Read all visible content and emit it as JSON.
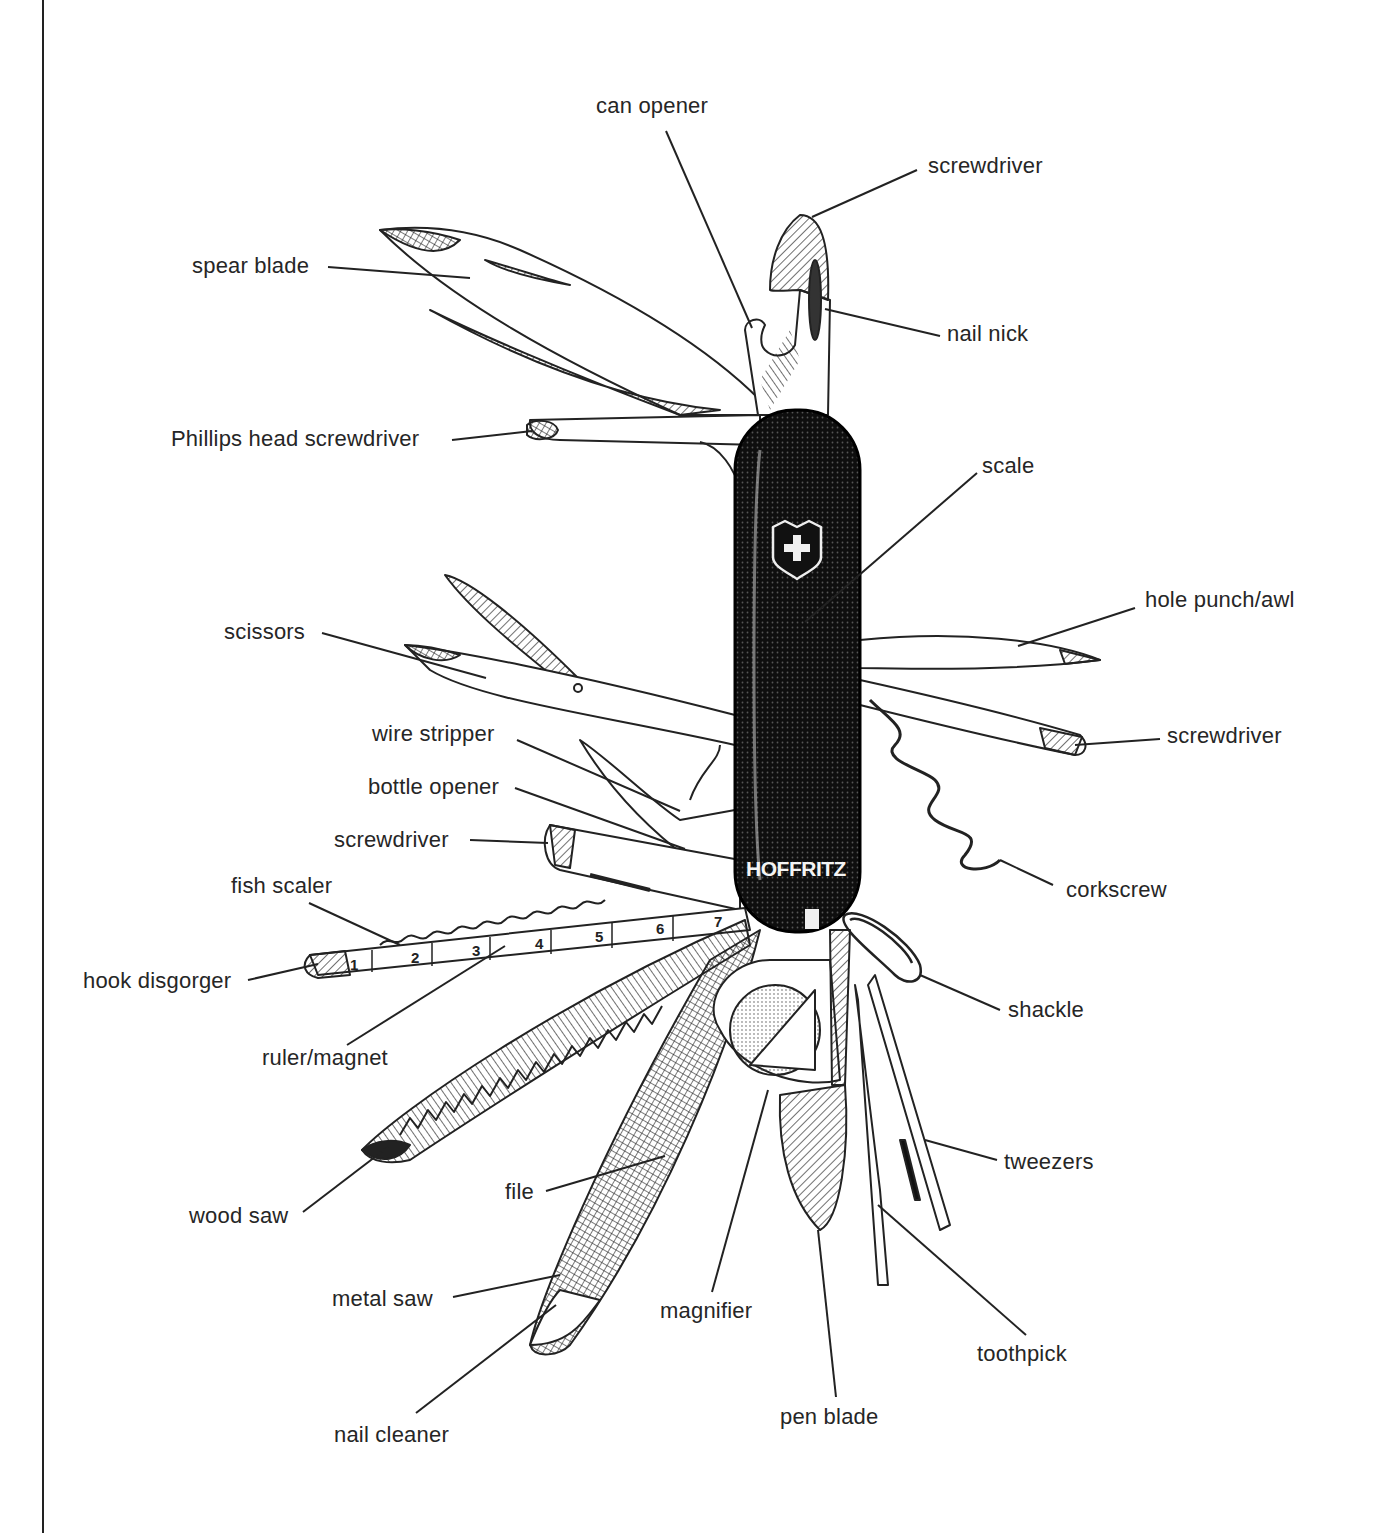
{
  "figure": {
    "brand_text": "HOFFRITZ",
    "emblem": "shield-cross-emblem",
    "colors": {
      "ink": "#222222",
      "paper": "#ffffff",
      "handle": "#111111"
    }
  },
  "labels": {
    "can_opener": "can opener",
    "screwdriver_top": "screwdriver",
    "spear_blade": "spear blade",
    "nail_nick": "nail nick",
    "phillips": "Phillips head screwdriver",
    "scale": "scale",
    "scissors": "scissors",
    "hole_punch": "hole punch/awl",
    "wire_stripper": "wire stripper",
    "screwdriver_right": "screwdriver",
    "bottle_opener": "bottle opener",
    "screwdriver_left": "screwdriver",
    "corkscrew": "corkscrew",
    "fish_scaler": "fish scaler",
    "hook_disgorger": "hook disgorger",
    "shackle": "shackle",
    "ruler_magnet": "ruler/magnet",
    "tweezers": "tweezers",
    "file": "file",
    "wood_saw": "wood saw",
    "metal_saw": "metal saw",
    "magnifier": "magnifier",
    "toothpick": "toothpick",
    "pen_blade": "pen blade",
    "nail_cleaner": "nail cleaner"
  },
  "ruler": {
    "numbers": [
      "1",
      "2",
      "3",
      "4",
      "5",
      "6",
      "7"
    ]
  }
}
